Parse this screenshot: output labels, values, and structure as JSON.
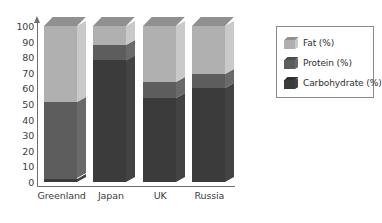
{
  "chart_data": {
    "type": "bar",
    "subtype": "stacked-100-percent-3d",
    "title": "",
    "xlabel": "",
    "ylabel": "",
    "ylim": [
      0,
      100
    ],
    "yticks": [
      0,
      10,
      20,
      30,
      40,
      50,
      60,
      70,
      80,
      90,
      100
    ],
    "grid": false,
    "legend_position": "right",
    "categories": [
      "Greenland",
      "Japan",
      "UK",
      "Russia"
    ],
    "series": [
      {
        "name": "Fat (%)",
        "key": "fat",
        "color": "#b0b0b0",
        "values": [
          49,
          12,
          36,
          31
        ]
      },
      {
        "name": "Protein (%)",
        "key": "protein",
        "color": "#5d5d5d",
        "values": [
          49,
          10,
          10,
          9
        ]
      },
      {
        "name": "Carbohydrate (%)",
        "key": "carbohydrate",
        "color": "#3b3b3b",
        "values": [
          2,
          78,
          54,
          60
        ]
      }
    ],
    "stack_order_bottom_to_top": [
      "carbohydrate",
      "protein",
      "fat"
    ],
    "cumulative_tops": {
      "Greenland": {
        "carbohydrate": 2,
        "protein": 51,
        "fat": 100
      },
      "Japan": {
        "carbohydrate": 78,
        "protein": 88,
        "fat": 100
      },
      "UK": {
        "carbohydrate": 54,
        "protein": 64,
        "fat": 100
      },
      "Russia": {
        "carbohydrate": 60,
        "protein": 69,
        "fat": 100
      }
    }
  },
  "axis": {
    "tick_labels": [
      "0",
      "10",
      "20",
      "30",
      "40",
      "50",
      "60",
      "70",
      "80",
      "90",
      "100"
    ]
  },
  "legend": {
    "items": [
      {
        "label": "Fat (%)"
      },
      {
        "label": "Protein (%)"
      },
      {
        "label": "Carbohydrate (%)"
      }
    ]
  }
}
